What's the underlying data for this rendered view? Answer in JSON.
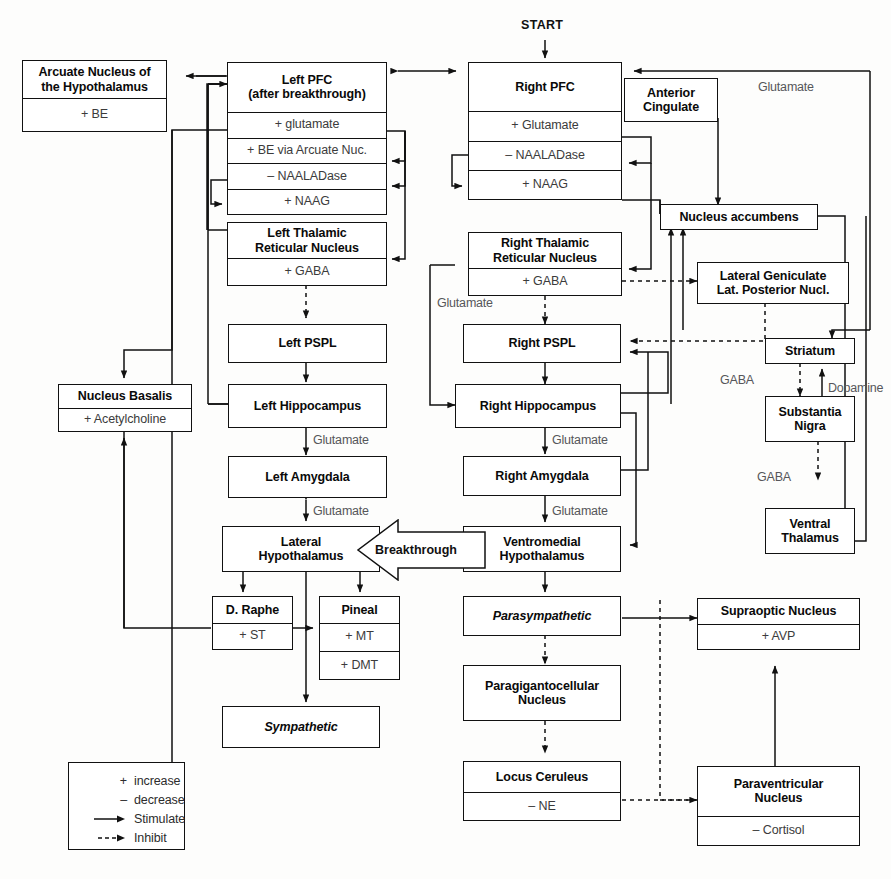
{
  "diagram": {
    "title_label": "START",
    "nodes": [
      {
        "id": "arcuate",
        "title": "Arcuate Nucleus of\nthe Hypothalamus",
        "sub": [
          "+ BE"
        ]
      },
      {
        "id": "left_pfc",
        "title": "Left PFC\n(after breakthrough)",
        "sub": [
          "+ glutamate",
          "+ BE  via Arcuate Nuc.",
          "– NAALADase",
          "+ NAAG"
        ]
      },
      {
        "id": "right_pfc",
        "title": "Right PFC",
        "sub": [
          "+ Glutamate",
          "– NAALADase",
          "+ NAAG"
        ]
      },
      {
        "id": "ant_cing",
        "title": "Anterior\nCingulate",
        "sub": []
      },
      {
        "id": "nuc_acc",
        "title": "Nucleus accumbens",
        "sub": []
      },
      {
        "id": "left_trn",
        "title": "Left Thalamic\nReticular Nucleus",
        "sub": [
          "+ GABA"
        ]
      },
      {
        "id": "right_trn",
        "title": "Right Thalamic\nReticular Nucleus",
        "sub": [
          "+ GABA"
        ]
      },
      {
        "id": "lgn",
        "title": "Lateral Geniculate\nLat. Posterior Nucl.",
        "sub": []
      },
      {
        "id": "nuc_bas",
        "title": "Nucleus Basalis",
        "sub": [
          "+ Acetylcholine"
        ]
      },
      {
        "id": "left_pspl",
        "title": "Left PSPL",
        "sub": []
      },
      {
        "id": "right_pspl",
        "title": "Right PSPL",
        "sub": []
      },
      {
        "id": "striatum",
        "title": "Striatum",
        "sub": []
      },
      {
        "id": "left_hip",
        "title": "Left Hippocampus",
        "sub": []
      },
      {
        "id": "right_hip",
        "title": "Right Hippocampus",
        "sub": []
      },
      {
        "id": "sub_nigra",
        "title": "Substantia\nNigra",
        "sub": []
      },
      {
        "id": "left_amyg",
        "title": "Left Amygdala",
        "sub": []
      },
      {
        "id": "right_amyg",
        "title": "Right Amygdala",
        "sub": []
      },
      {
        "id": "vent_thal",
        "title": "Ventral\nThalamus",
        "sub": []
      },
      {
        "id": "lat_hypo",
        "title": "Lateral\nHypothalamus",
        "sub": []
      },
      {
        "id": "vm_hypo",
        "title": "Ventromedial\nHypothalamus",
        "sub": []
      },
      {
        "id": "d_raphe",
        "title": "D. Raphe",
        "sub": [
          "+ ST"
        ]
      },
      {
        "id": "pineal",
        "title": "Pineal",
        "sub": [
          "+ MT",
          "+ DMT"
        ]
      },
      {
        "id": "parasym",
        "title": "Parasympathetic",
        "sub": [],
        "italic": true
      },
      {
        "id": "supraoptic",
        "title": "Supraoptic Nucleus",
        "sub": [
          "+ AVP"
        ]
      },
      {
        "id": "paragig",
        "title": "Paragigantocellular\nNucleus",
        "sub": []
      },
      {
        "id": "sympath",
        "title": "Sympathetic",
        "sub": [],
        "italic": true
      },
      {
        "id": "locus",
        "title": "Locus Ceruleus",
        "sub": [
          "– NE"
        ]
      },
      {
        "id": "paravent",
        "title": "Paraventricular\nNucleus",
        "sub": [
          "– Cortisol"
        ]
      }
    ],
    "edge_labels": [
      {
        "id": "glutamate_top_right",
        "text": "Glutamate"
      },
      {
        "id": "glutamate_mid_left",
        "text": "Glutamate"
      },
      {
        "id": "glutamate_left_hip",
        "text": "Glutamate"
      },
      {
        "id": "glutamate_left_amyg",
        "text": "Glutamate"
      },
      {
        "id": "glutamate_right_hip",
        "text": "Glutamate"
      },
      {
        "id": "glutamate_right_amyg",
        "text": "Glutamate"
      },
      {
        "id": "gaba_striatum",
        "text": "GABA"
      },
      {
        "id": "dopamine",
        "text": "Dopamine"
      },
      {
        "id": "gaba_nigra",
        "text": "GABA"
      }
    ],
    "breakthrough_label": "Breakthrough",
    "legend": {
      "rows": [
        {
          "sym": "+",
          "text": "increase"
        },
        {
          "sym": "–",
          "text": "decrease"
        },
        {
          "sym": "arrow-solid",
          "text": "Stimulate"
        },
        {
          "sym": "arrow-dashed",
          "text": "Inhibit"
        }
      ]
    },
    "colors": {
      "stroke": "#111111",
      "label": "#56565a",
      "background": "#fdfdfc"
    }
  }
}
